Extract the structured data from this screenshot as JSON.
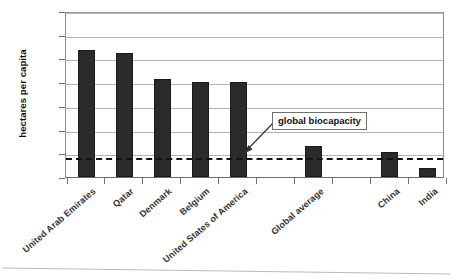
{
  "chart_data": {
    "type": "bar",
    "title": "",
    "xlabel": "",
    "ylabel": "hectares per capita",
    "ylim": [
      0.0,
      14.0
    ],
    "ytick_step": 2.0,
    "ytick_labels": [
      "0.0",
      "2.0",
      "4.0",
      "6.0",
      "8.0",
      "10.0",
      "12.0",
      "14.0"
    ],
    "ytick_values": [
      0.0,
      2.0,
      4.0,
      6.0,
      8.0,
      10.0,
      12.0,
      14.0
    ],
    "grid": "horizontal",
    "legend": "none",
    "categories": [
      "United Arab Emirates",
      "Qatar",
      "Denmark",
      "Belgium",
      "United States of America",
      "Global average",
      "China",
      "India"
    ],
    "values": [
      10.7,
      10.5,
      8.25,
      8.0,
      8.0,
      2.6,
      2.1,
      0.8
    ],
    "slots": [
      {
        "label": "United Arab Emirates",
        "value": 10.7,
        "slot": 0
      },
      {
        "label": "Qatar",
        "value": 10.5,
        "slot": 1
      },
      {
        "label": "Denmark",
        "value": 8.25,
        "slot": 2
      },
      {
        "label": "Belgium",
        "value": 8.0,
        "slot": 3
      },
      {
        "label": "United States of America",
        "value": 8.0,
        "slot": 4
      },
      {
        "label": "",
        "value": null,
        "slot": 5
      },
      {
        "label": "Global average",
        "value": 2.6,
        "slot": 6
      },
      {
        "label": "",
        "value": null,
        "slot": 7
      },
      {
        "label": "China",
        "value": 2.1,
        "slot": 8
      },
      {
        "label": "India",
        "value": 0.8,
        "slot": 9
      }
    ],
    "reference_line": {
      "label": "global biocapacity",
      "value": 1.8,
      "style": "dashed"
    },
    "annotation": {
      "text": "global biocapacity",
      "points_to": "reference_line"
    },
    "colors": {
      "bar": "#2b2b2b",
      "grid": "#b4b4b4",
      "axis": "#6f6f6f",
      "reference_line": "#111111",
      "background": "#ffffff"
    }
  }
}
